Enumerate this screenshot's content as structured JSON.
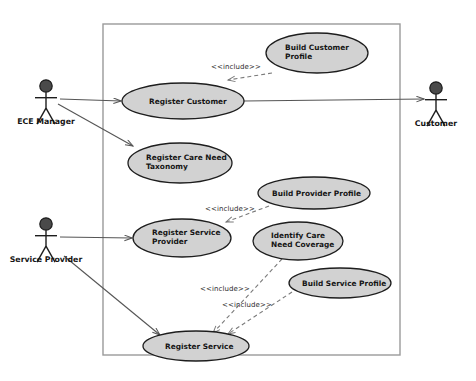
{
  "diagram": {
    "kind": "uml-use-case-diagram",
    "colors": {
      "ellipse_fill": "#d2d2d2",
      "ellipse_stroke": "#1d1d1d",
      "actor_head_fill": "#4a4a4a",
      "actor_stroke": "#1d1d1d",
      "boundary_stroke": "#9a9a9a",
      "line_stroke": "#555555",
      "include_stroke": "#7a7a7a",
      "text": "#151515",
      "background": "#ffffff"
    },
    "system_boundary": {
      "name": "system-boundary",
      "x": 103,
      "y": 24,
      "width": 297,
      "height": 331
    },
    "actors": [
      {
        "id": "ece-manager",
        "label": "ECE Manager",
        "cx": 46,
        "head_cy": 86,
        "label_y": 124
      },
      {
        "id": "service-provider",
        "label": "Service Provider",
        "cx": 46,
        "head_cy": 224,
        "label_y": 262
      },
      {
        "id": "customer",
        "label": "Customer",
        "cx": 436,
        "head_cy": 88,
        "label_y": 126
      }
    ],
    "use_cases": [
      {
        "id": "register-customer",
        "lines": [
          "Register Customer"
        ],
        "cx": 183,
        "cy": 101,
        "rx": 61,
        "ry": 18,
        "text_x": 149,
        "text_y": 104,
        "align": "start"
      },
      {
        "id": "build-customer-profile",
        "lines": [
          "Build Customer",
          "Profile"
        ],
        "cx": 317,
        "cy": 53,
        "rx": 51,
        "ry": 20,
        "text_x": 285,
        "text_y": 50,
        "align": "start"
      },
      {
        "id": "register-care-need-taxonomy",
        "lines": [
          "Register Care Need",
          "Taxonomy"
        ],
        "cx": 180,
        "cy": 163,
        "rx": 52,
        "ry": 20,
        "text_x": 146,
        "text_y": 160,
        "align": "start"
      },
      {
        "id": "build-provider-profile",
        "lines": [
          "Build Provider Profile"
        ],
        "cx": 314,
        "cy": 193,
        "rx": 56,
        "ry": 16,
        "text_x": 272,
        "text_y": 196,
        "align": "start"
      },
      {
        "id": "register-service-provider",
        "lines": [
          "Register Service",
          "Provider"
        ],
        "cx": 182,
        "cy": 238,
        "rx": 49,
        "ry": 19,
        "text_x": 152,
        "text_y": 235,
        "align": "start"
      },
      {
        "id": "identify-care-need-coverage",
        "lines": [
          "Identify Care",
          "Need Coverage"
        ],
        "cx": 298,
        "cy": 241,
        "rx": 45,
        "ry": 19,
        "text_x": 271,
        "text_y": 238,
        "align": "start"
      },
      {
        "id": "build-service-profile",
        "lines": [
          "Build Service Profile"
        ],
        "cx": 340,
        "cy": 283,
        "rx": 51,
        "ry": 15,
        "text_x": 302,
        "text_y": 286,
        "align": "start"
      },
      {
        "id": "register-service",
        "lines": [
          "Register Service"
        ],
        "cx": 196,
        "cy": 346,
        "rx": 53,
        "ry": 15,
        "text_x": 165,
        "text_y": 349,
        "align": "start"
      }
    ],
    "associations": [
      {
        "id": "ece-manager-to-register-customer",
        "from": "ece-manager",
        "to": "register-customer",
        "x1": 60,
        "y1": 99,
        "x2": 121,
        "y2": 101
      },
      {
        "id": "ece-manager-to-register-care-need-taxonomy",
        "from": "ece-manager",
        "to": "register-care-need-taxonomy",
        "x1": 58,
        "y1": 104,
        "x2": 133,
        "y2": 146
      },
      {
        "id": "register-customer-to-customer",
        "from": "register-customer",
        "to": "customer",
        "x1": 244,
        "y1": 101,
        "x2": 424,
        "y2": 99
      },
      {
        "id": "service-provider-to-register-service-provider",
        "from": "service-provider",
        "to": "register-service-provider",
        "x1": 60,
        "y1": 237,
        "x2": 132,
        "y2": 238
      },
      {
        "id": "service-provider-to-register-service",
        "from": "service-provider",
        "to": "register-service",
        "x1": 64,
        "y1": 256,
        "x2": 160,
        "y2": 335
      }
    ],
    "includes": [
      {
        "id": "include-build-customer-profile",
        "label": "<<include>>",
        "from": "build-customer-profile",
        "to": "register-customer",
        "x1": 272,
        "y1": 73,
        "x2": 228,
        "y2": 80,
        "label_x": 211,
        "label_y": 69
      },
      {
        "id": "include-build-provider-profile",
        "label": "<<include>>",
        "from": "build-provider-profile",
        "to": "register-service-provider",
        "x1": 269,
        "y1": 206,
        "x2": 226,
        "y2": 222,
        "label_x": 205,
        "label_y": 211
      },
      {
        "id": "include-identify-care-need-coverage",
        "label": "<<include>>",
        "from": "identify-care-need-coverage",
        "to": "register-service",
        "x1": 282,
        "y1": 259,
        "x2": 213,
        "y2": 333,
        "label_x": 200,
        "label_y": 291
      },
      {
        "id": "include-build-service-profile",
        "label": "<<include>>",
        "from": "build-service-profile",
        "to": "register-service",
        "x1": 292,
        "y1": 292,
        "x2": 228,
        "y2": 334,
        "label_x": 222,
        "label_y": 307
      }
    ]
  }
}
